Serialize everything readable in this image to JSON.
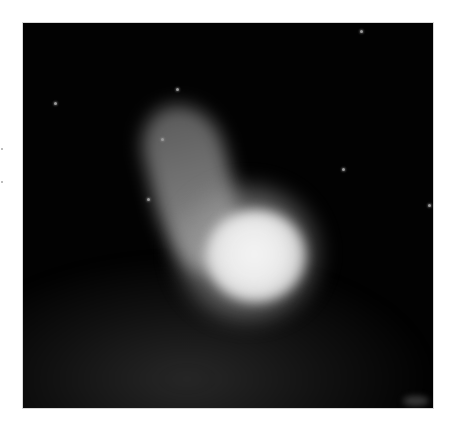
{
  "image": {
    "subject": "glowing plume with bright core on dark background",
    "frame": {
      "x": 22,
      "y": 22,
      "width": 412,
      "height": 387
    },
    "colors": {
      "background": "#020202",
      "core": "#f4f4f4",
      "tail": "#8c8c8c",
      "haze": "#464646",
      "page": "#ffffff"
    },
    "stars": [
      {
        "x": 153,
        "y": 65
      },
      {
        "x": 31,
        "y": 79
      },
      {
        "x": 138,
        "y": 115
      },
      {
        "x": 319,
        "y": 145
      },
      {
        "x": 124,
        "y": 175
      },
      {
        "x": 337,
        "y": 7
      },
      {
        "x": 405,
        "y": 181
      }
    ]
  }
}
